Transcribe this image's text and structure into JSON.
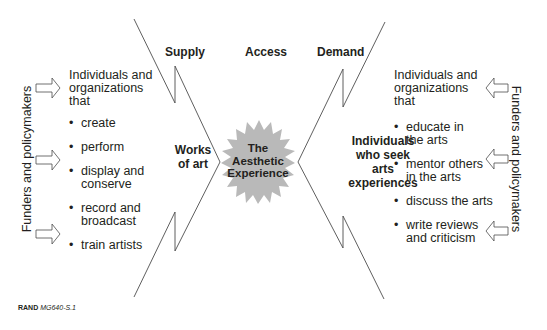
{
  "figure": {
    "headers": {
      "supply": "Supply",
      "access": "Access",
      "demand": "Demand"
    },
    "center": {
      "star_label_lines": [
        "The",
        "Aesthetic",
        "Experience"
      ],
      "star_fill": "#b9b9b9"
    },
    "supply_side": {
      "label_lines": [
        "Works",
        "of art"
      ],
      "intro_lines": [
        "Individuals and",
        "organizations",
        "that"
      ],
      "items": [
        [
          "create"
        ],
        [
          "perform"
        ],
        [
          "display and",
          "conserve"
        ],
        [
          "record and",
          "broadcast"
        ],
        [
          "train artists"
        ]
      ],
      "side_label": "Funders and policymakers",
      "arrows": 3
    },
    "demand_side": {
      "label_lines": [
        "Individuals",
        "who seek",
        "arts",
        "experiences"
      ],
      "intro_lines": [
        "Individuals and",
        "organizations",
        "that"
      ],
      "items": [
        [
          "educate in",
          "the arts"
        ],
        [
          "mentor others",
          "in the arts"
        ],
        [
          "discuss the arts"
        ],
        [
          "write reviews",
          "and criticism"
        ]
      ],
      "side_label": "Funders and policymakers",
      "arrows": 3
    },
    "caption": {
      "org": "RAND",
      "id": "MG640-S.1"
    }
  }
}
